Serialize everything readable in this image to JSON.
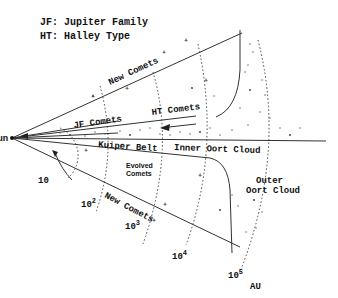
{
  "legend": {
    "jf": "JF: Jupiter Family",
    "ht": "HT: Halley Type"
  },
  "labels": {
    "sun": "Sun",
    "new_comets_top": "New Comets",
    "new_comets_bottom": "New Comets",
    "jf_comets": "JF Comets",
    "ht_comets": "HT Comets",
    "kuiper_belt": "Kuiper Belt",
    "inner_oort": "Inner Oort Cloud",
    "evolved_1": "Evolved",
    "evolved_2": "Comets",
    "outer_oort_1": "Outer",
    "outer_oort_2": "Oort Cloud",
    "unit": "AU"
  },
  "distance_scale": [
    {
      "base": "10",
      "exp": ""
    },
    {
      "base": "10",
      "exp": "2"
    },
    {
      "base": "10",
      "exp": "3"
    },
    {
      "base": "10",
      "exp": "4"
    },
    {
      "base": "10",
      "exp": "5"
    }
  ]
}
